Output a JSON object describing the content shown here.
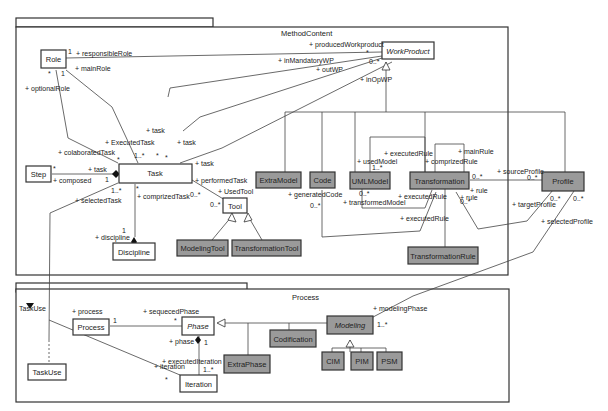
{
  "packages": [
    {
      "name": "MethodContent",
      "title_label": "MethodContent"
    },
    {
      "name": "Process",
      "title_label": "Process"
    }
  ],
  "classes": {
    "role": "Role",
    "work_product": "WorkProduct",
    "step": "Step",
    "task": "Task",
    "discipline": "Discipline",
    "tool": "Tool",
    "modeling_tool": "ModelingTool",
    "transformation_tool": "TransformationTool",
    "extra_model": "ExtraModel",
    "code": "Code",
    "uml_model": "UMLModel",
    "transformation": "Transformation",
    "profile": "Profile",
    "transformation_rule": "TransformationRule",
    "process": "Process",
    "phase": "Phase",
    "codification": "Codification",
    "modeling": "Modeling",
    "extra_phase": "ExtraPhase",
    "cim": "CIM",
    "pim": "PIM",
    "psm": "PSM",
    "iteration": "Iteration",
    "task_use": "TaskUse"
  },
  "labels": {
    "responsible_role": "+ responsibleRole",
    "main_role": "+ mainRole",
    "optional_role": "+ optionalRole",
    "produced_workproduct": "+ producedWorkproduct",
    "in_mandatory_wp": "+ inMandatoryWP",
    "out_wp": "+ outWP",
    "in_op_wp": "+ inOpWP",
    "task1": "+ task",
    "task2": "+ task",
    "task3": "+ task",
    "executed_task": "+ ExecutedTask",
    "colaborated_task": "+ colaboratedTask",
    "task_step": "+ task",
    "composed": "+ composed",
    "selected_task": "+ selectedTask",
    "comprized_task": "+ comprizedTask",
    "performed_task": "+ performedTask",
    "used_tool": "+ UsedTool",
    "discipline": "+ discipline",
    "generated_code": "+ generatedCode",
    "used_model": "+ usedModel",
    "transformed_model": "+ transformedModel",
    "executed_rule1": "+ executedRule",
    "executed_rule2": "+ executedRule",
    "executed_rule3": "+ executedRule",
    "comprized_rule": "+ comprizedRule",
    "main_rule": "+ mainRule",
    "rule1": "+ rule",
    "rule2": "+ rule",
    "source_profile": "+ sourceProfile",
    "target_profile": "+ targetProfile",
    "selected_profile": "+ selectedProfile",
    "process": "+ process",
    "sequeced_phase": "+ sequecedPhase",
    "phase": "+ phase",
    "executed_iteration": "+ executedIteration",
    "iteration": "+ iteration",
    "modeling_phase": "+ modelingPhase",
    "task_use_stereo": "TaskUse"
  },
  "multiplicities": {
    "m1": "1",
    "m_star": "*",
    "m_one": "1",
    "m_0n": "0..*",
    "m_1n": "1..*"
  },
  "colors": {
    "class_fill_white": "#ffffff",
    "class_fill_gray": "#9a9a9a",
    "stroke": "#333333"
  }
}
